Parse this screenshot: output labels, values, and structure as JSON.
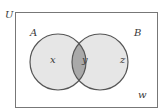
{
  "diagram": {
    "type": "venn",
    "universe_label": "U",
    "sets": [
      {
        "label": "A",
        "region_label": "x"
      },
      {
        "label": "B",
        "region_label": "z"
      }
    ],
    "intersection_label": "y",
    "outside_label": "w",
    "colors": {
      "border": "#555555",
      "set_fill": "#e6e6e6",
      "intersection_fill": "#a9a9a9",
      "background": "#ffffff"
    }
  }
}
